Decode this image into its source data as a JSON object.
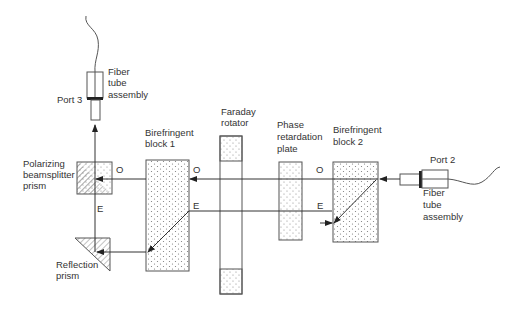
{
  "diagram": {
    "type": "optical-circulator-schematic",
    "labels": {
      "port3": "Port 3",
      "fiber_top_1": "Fiber",
      "fiber_top_2": "tube",
      "fiber_top_3": "assembly",
      "pbs_1": "Polarizing",
      "pbs_2": "beamsplitter",
      "pbs_3": "prism",
      "reflection_1": "Reflection",
      "reflection_2": "prism",
      "bb1_1": "Birefringent",
      "bb1_2": "block 1",
      "faraday_1": "Faraday",
      "faraday_2": "rotator",
      "phase_1": "Phase",
      "phase_2": "retardation",
      "phase_3": "plate",
      "bb2_1": "Birefringent",
      "bb2_2": "block 2",
      "port2": "Port 2",
      "fiber_right_1": "Fiber",
      "fiber_right_2": "tube",
      "fiber_right_3": "assembly",
      "o": "O",
      "e": "E"
    },
    "colors": {
      "line": "#555555",
      "text": "#333333",
      "dots": "#777777"
    }
  }
}
